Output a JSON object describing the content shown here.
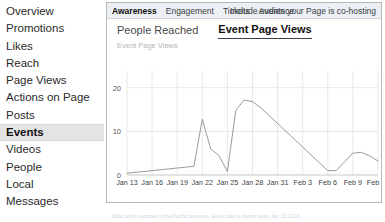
{
  "sidebar": {
    "items": [
      {
        "label": "Overview",
        "active": false
      },
      {
        "label": "Promotions",
        "active": false
      },
      {
        "label": "Likes",
        "active": false
      },
      {
        "label": "Reach",
        "active": false
      },
      {
        "label": "Page Views",
        "active": false
      },
      {
        "label": "Actions on Page",
        "active": false
      },
      {
        "label": "Posts",
        "active": false
      },
      {
        "label": "Events",
        "active": true
      },
      {
        "label": "Videos",
        "active": false
      },
      {
        "label": "People",
        "active": false
      },
      {
        "label": "Local",
        "active": false
      },
      {
        "label": "Messages",
        "active": false
      }
    ]
  },
  "panel": {
    "tabs": [
      {
        "label": "Awareness",
        "active": true
      },
      {
        "label": "Engagement",
        "active": false
      },
      {
        "label": "Tickets",
        "active": false
      },
      {
        "label": "Audience",
        "active": false
      }
    ],
    "cohost_label": "Include events your Page is co-hosting",
    "metrics": [
      {
        "label": "People Reached",
        "active": false
      },
      {
        "label": "Event Page Views",
        "active": true
      }
    ],
    "axis_title": "Event Page Views",
    "caption": "Data points reported in the Pacific timezone. Event data is shown since Jan 13, 2016."
  },
  "colors": {
    "line": "#9a9a9a",
    "grid": "#d9d9d9",
    "axis": "#b0b0b0",
    "active_bg": "#e4e4e4",
    "tabbar_bg": "#eceff3"
  },
  "chart_data": {
    "type": "line",
    "title": "Event Page Views",
    "xlabel": "",
    "ylabel": "Event Page Views",
    "ylim": [
      0,
      22
    ],
    "yticks": [
      0,
      10,
      20
    ],
    "grid": true,
    "legend": false,
    "x": [
      "Jan 13",
      "Jan 14",
      "Jan 15",
      "Jan 16",
      "Jan 17",
      "Jan 18",
      "Jan 19",
      "Jan 20",
      "Jan 21",
      "Jan 22",
      "Jan 23",
      "Jan 24",
      "Jan 25",
      "Jan 26",
      "Jan 27",
      "Jan 28",
      "Jan 29",
      "Jan 30",
      "Jan 31",
      "Feb 1",
      "Feb 2",
      "Feb 3",
      "Feb 4",
      "Feb 5",
      "Feb 6",
      "Feb 7",
      "Feb 8",
      "Feb 9",
      "Feb 10",
      "Feb 11",
      "Feb 12"
    ],
    "xticks": [
      "Jan 13",
      "Jan 16",
      "Jan 19",
      "Jan 22",
      "Jan 25",
      "Jan 28",
      "Jan 31",
      "Feb 3",
      "Feb 6",
      "Feb 9",
      "Feb 12"
    ],
    "values": [
      0.4,
      0.6,
      0.8,
      1.0,
      1.2,
      1.4,
      1.6,
      1.8,
      2.0,
      12.8,
      6.0,
      4.4,
      0.8,
      14.8,
      17.2,
      16.8,
      15.4,
      13.6,
      11.8,
      10.0,
      8.2,
      6.4,
      4.6,
      2.8,
      1.0,
      1.0,
      3.0,
      5.0,
      5.2,
      4.4,
      3.2
    ],
    "series": [
      {
        "name": "Event Page Views",
        "values": [
          0.4,
          0.6,
          0.8,
          1.0,
          1.2,
          1.4,
          1.6,
          1.8,
          2.0,
          12.8,
          6.0,
          4.4,
          0.8,
          14.8,
          17.2,
          16.8,
          15.4,
          13.6,
          11.8,
          10.0,
          8.2,
          6.4,
          4.6,
          2.8,
          1.0,
          1.0,
          3.0,
          5.0,
          5.2,
          4.4,
          3.2
        ]
      }
    ]
  }
}
